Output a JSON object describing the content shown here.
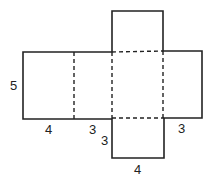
{
  "diagram": {
    "type": "net-of-rectangular-prism",
    "colors": {
      "line": "#222222",
      "background": "#ffffff"
    },
    "labels": {
      "left_height": "5",
      "left_width": "4",
      "middle_width": "3",
      "bottom_side": "3",
      "right_width": "3",
      "bottom_width": "4"
    }
  }
}
